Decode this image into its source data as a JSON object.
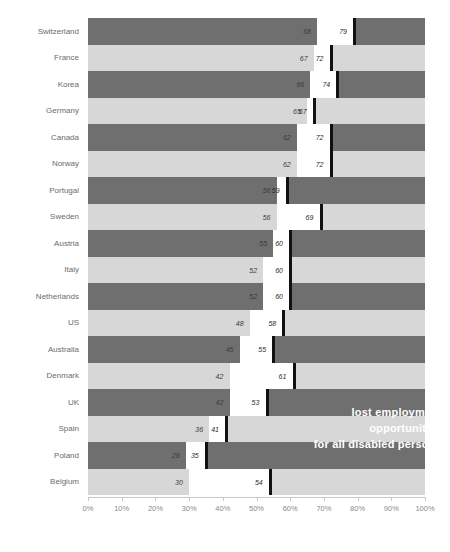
{
  "chart_data": {
    "type": "bar",
    "title": "",
    "subtitle": "",
    "xlabel": "",
    "ylabel": "",
    "xlim": [
      0,
      100
    ],
    "grid": false,
    "legend_position": "none",
    "orientation": "horizontal",
    "annotation": [
      "lost employment",
      "opportunities",
      "for all disabled persons"
    ],
    "axis_ticks": [
      "0%",
      "10%",
      "20%",
      "30%",
      "40%",
      "50%",
      "60%",
      "70%",
      "80%",
      "90%",
      "100%"
    ],
    "axis_tick_values": [
      0,
      10,
      20,
      30,
      40,
      50,
      60,
      70,
      80,
      90,
      100
    ],
    "categories": [
      "Switzerland",
      "France",
      "Korea",
      "Germany",
      "Canada",
      "Norway",
      "Portugal",
      "Sweden",
      "Austria",
      "Italy",
      "Netherlands",
      "US",
      "Australia",
      "Denmark",
      "UK",
      "Spain",
      "Poland",
      "Belgium"
    ],
    "series": [
      {
        "name": "disabled persons employment rate",
        "values": [
          68,
          67,
          66,
          65,
          62,
          62,
          56,
          56,
          55,
          52,
          52,
          48,
          45,
          42,
          42,
          36,
          29,
          30
        ]
      },
      {
        "name": "all persons employment rate",
        "values": [
          79,
          72,
          74,
          67,
          72,
          72,
          59,
          69,
          60,
          60,
          60,
          58,
          55,
          61,
          53,
          41,
          35,
          54
        ]
      }
    ],
    "rows": [
      {
        "label": "Switzerland",
        "v1": 68,
        "v2": 79,
        "band": "dark"
      },
      {
        "label": "France",
        "v1": 67,
        "v2": 72,
        "band": "light"
      },
      {
        "label": "Korea",
        "v1": 66,
        "v2": 74,
        "band": "dark"
      },
      {
        "label": "Germany",
        "v1": 65,
        "v2": 67,
        "band": "light"
      },
      {
        "label": "Canada",
        "v1": 62,
        "v2": 72,
        "band": "dark"
      },
      {
        "label": "Norway",
        "v1": 62,
        "v2": 72,
        "band": "light"
      },
      {
        "label": "Portugal",
        "v1": 56,
        "v2": 59,
        "band": "dark"
      },
      {
        "label": "Sweden",
        "v1": 56,
        "v2": 69,
        "band": "light"
      },
      {
        "label": "Austria",
        "v1": 55,
        "v2": 60,
        "band": "dark"
      },
      {
        "label": "Italy",
        "v1": 52,
        "v2": 60,
        "band": "light"
      },
      {
        "label": "Netherlands",
        "v1": 52,
        "v2": 60,
        "band": "dark"
      },
      {
        "label": "US",
        "v1": 48,
        "v2": 58,
        "band": "light"
      },
      {
        "label": "Australia",
        "v1": 45,
        "v2": 55,
        "band": "dark"
      },
      {
        "label": "Denmark",
        "v1": 42,
        "v2": 61,
        "band": "light"
      },
      {
        "label": "UK",
        "v1": 42,
        "v2": 53,
        "band": "dark"
      },
      {
        "label": "Spain",
        "v1": 36,
        "v2": 41,
        "band": "light"
      },
      {
        "label": "Poland",
        "v1": 29,
        "v2": 35,
        "band": "dark"
      },
      {
        "label": "Belgium",
        "v1": 30,
        "v2": 54,
        "band": "light"
      }
    ],
    "colors": {
      "band_dark": "#6f6f6f",
      "band_light": "#d7d7d7",
      "segment": "#ffffff",
      "cap": "#111111",
      "axis": "#c9c9c9",
      "tick_label": "#8a8a8a",
      "category_label": "#6b6b6b",
      "annotation_text": "#ffffff"
    }
  }
}
